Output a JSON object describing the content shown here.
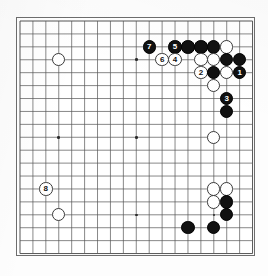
{
  "diagram": {
    "kind": "go-board-diagram",
    "board_size": 19,
    "background_color": "#ffffff",
    "board_border_color": "#6d6d6d",
    "grid_line_color": "#555555",
    "black_stone_color": "#111111",
    "white_stone_color": "#ffffff",
    "white_stone_outline_color": "#3a3a3a",
    "black_label_color": "#ffffff",
    "white_label_color": "#111111",
    "geometry": {
      "origin_x": 19,
      "origin_y": 20,
      "spacing": 12.92,
      "stone_diameter": 13.4
    },
    "star_points": [
      {
        "col": 3,
        "row": 3
      },
      {
        "col": 9,
        "row": 3
      },
      {
        "col": 15,
        "row": 3
      },
      {
        "col": 3,
        "row": 9
      },
      {
        "col": 9,
        "row": 9
      },
      {
        "col": 15,
        "row": 9
      },
      {
        "col": 3,
        "row": 15
      },
      {
        "col": 9,
        "row": 15
      },
      {
        "col": 15,
        "row": 15
      }
    ],
    "stones": [
      {
        "col": 3,
        "row": 3,
        "color": "white",
        "label": ""
      },
      {
        "col": 10,
        "row": 2,
        "color": "black",
        "label": "7"
      },
      {
        "col": 12,
        "row": 2,
        "color": "black",
        "label": "5"
      },
      {
        "col": 13,
        "row": 2,
        "color": "black",
        "label": ""
      },
      {
        "col": 14,
        "row": 2,
        "color": "black",
        "label": ""
      },
      {
        "col": 15,
        "row": 2,
        "color": "black",
        "label": ""
      },
      {
        "col": 16,
        "row": 2,
        "color": "white",
        "label": ""
      },
      {
        "col": 11,
        "row": 3,
        "color": "white",
        "label": "6"
      },
      {
        "col": 12,
        "row": 3,
        "color": "white",
        "label": "4"
      },
      {
        "col": 14,
        "row": 3,
        "color": "white",
        "label": ""
      },
      {
        "col": 15,
        "row": 3,
        "color": "white",
        "label": ""
      },
      {
        "col": 16,
        "row": 3,
        "color": "black",
        "label": ""
      },
      {
        "col": 17,
        "row": 3,
        "color": "black",
        "label": ""
      },
      {
        "col": 14,
        "row": 4,
        "color": "white",
        "label": "2"
      },
      {
        "col": 15,
        "row": 4,
        "color": "black",
        "label": ""
      },
      {
        "col": 16,
        "row": 4,
        "color": "white",
        "label": ""
      },
      {
        "col": 17,
        "row": 4,
        "color": "black",
        "label": "1"
      },
      {
        "col": 15,
        "row": 5,
        "color": "white",
        "label": ""
      },
      {
        "col": 16,
        "row": 6,
        "color": "black",
        "label": "3"
      },
      {
        "col": 16,
        "row": 7,
        "color": "black",
        "label": ""
      },
      {
        "col": 15,
        "row": 9,
        "color": "white",
        "label": ""
      },
      {
        "col": 2,
        "row": 13,
        "color": "white",
        "label": "8"
      },
      {
        "col": 3,
        "row": 15,
        "color": "white",
        "label": ""
      },
      {
        "col": 15,
        "row": 13,
        "color": "white",
        "label": ""
      },
      {
        "col": 16,
        "row": 13,
        "color": "white",
        "label": ""
      },
      {
        "col": 15,
        "row": 14,
        "color": "white",
        "label": ""
      },
      {
        "col": 16,
        "row": 14,
        "color": "black",
        "label": ""
      },
      {
        "col": 16,
        "row": 15,
        "color": "black",
        "label": ""
      },
      {
        "col": 13,
        "row": 16,
        "color": "black",
        "label": ""
      },
      {
        "col": 15,
        "row": 16,
        "color": "black",
        "label": ""
      }
    ],
    "move_labels": [
      "1",
      "2",
      "3",
      "4",
      "5",
      "6",
      "7",
      "8"
    ]
  }
}
